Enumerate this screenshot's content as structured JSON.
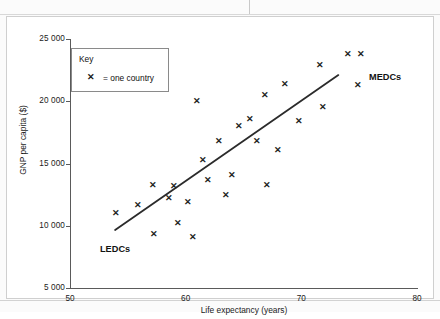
{
  "figure": {
    "background": "#ffffff",
    "frame_color": "#cfcfcf"
  },
  "key": {
    "title": "Key",
    "marker_glyph": "✕",
    "marker_text": "= one country"
  },
  "annotations": {
    "ledcs": "LEDCs",
    "medcs": "MEDCs"
  },
  "chart_data": {
    "type": "scatter",
    "title": "",
    "xlabel": "Life expectancy (years)",
    "ylabel": "GNP per capita ($)",
    "xlim": [
      50,
      80
    ],
    "ylim": [
      5000,
      25000
    ],
    "xticks": [
      50,
      60,
      70,
      80
    ],
    "xtick_labels": [
      "50",
      "60",
      "70",
      "80"
    ],
    "yticks": [
      5000,
      10000,
      15000,
      20000,
      25000
    ],
    "ytick_labels": [
      "5 000",
      "10 000",
      "15 000",
      "20 000",
      "25 000"
    ],
    "grid": false,
    "legend": "inside-top-left",
    "marker": "x",
    "marker_color": "#232323",
    "series": [
      {
        "name": "one country",
        "points": [
          [
            54.0,
            11000
          ],
          [
            55.9,
            11700
          ],
          [
            57.2,
            13300
          ],
          [
            57.3,
            9300
          ],
          [
            58.6,
            12200
          ],
          [
            59.0,
            13200
          ],
          [
            59.3,
            10200
          ],
          [
            60.2,
            11900
          ],
          [
            60.6,
            9100
          ],
          [
            61.0,
            20000
          ],
          [
            61.5,
            15300
          ],
          [
            61.9,
            13700
          ],
          [
            62.9,
            16800
          ],
          [
            63.5,
            12500
          ],
          [
            64.0,
            14100
          ],
          [
            64.6,
            18000
          ],
          [
            65.6,
            18600
          ],
          [
            66.2,
            16800
          ],
          [
            66.9,
            20500
          ],
          [
            67.0,
            13300
          ],
          [
            68.0,
            16100
          ],
          [
            68.6,
            21400
          ],
          [
            69.8,
            18400
          ],
          [
            71.6,
            22900
          ],
          [
            71.9,
            19500
          ],
          [
            74.0,
            23800
          ],
          [
            75.2,
            23800
          ],
          [
            74.9,
            21300
          ]
        ]
      }
    ],
    "trend_line": {
      "label": "best fit line",
      "color": "#2b2b2b",
      "x_start": 53.9,
      "y_start": 9650,
      "x_end": 73.2,
      "y_end": 22100
    }
  }
}
